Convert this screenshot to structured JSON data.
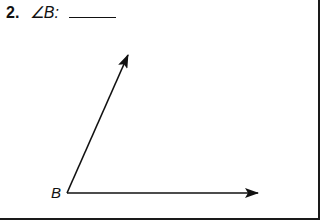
{
  "question": {
    "number": "2.",
    "label": "∠B:",
    "answer": ""
  },
  "diagram": {
    "vertex_label": "B",
    "vertex": [
      67,
      193
    ],
    "ray_up_end": [
      128,
      55
    ],
    "ray_right_end": [
      258,
      193
    ],
    "stroke_color": "#111111"
  }
}
